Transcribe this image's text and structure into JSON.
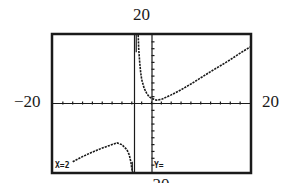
{
  "labels": {
    "ymax": "20",
    "xmin": "−20",
    "xmax": "20",
    "ymin": "−20"
  },
  "readout": {
    "x_text": "X=2",
    "y_text": "Y="
  },
  "colors": {
    "ink": "#1a1a1a",
    "background": "#ffffff"
  },
  "chart_data": {
    "type": "line",
    "title": "",
    "xlabel": "",
    "ylabel": "",
    "xlim": [
      -20,
      20
    ],
    "ylim": [
      -20,
      20
    ],
    "grid": false,
    "x_tick_spacing": 2,
    "y_tick_spacing": 2,
    "window_labels": {
      "top": "20",
      "left": "-20",
      "right": "20",
      "bottom": "-20"
    },
    "vertical_asymptote_x": -3.4,
    "trace_readout": {
      "x": "X=2",
      "y": "Y="
    },
    "series": [
      {
        "name": "right-branch",
        "x": [
          -2.7,
          -2.6,
          -2.4,
          -2.2,
          -2.0,
          -1.5,
          -1.0,
          -0.5,
          0,
          1,
          2,
          4,
          6,
          8,
          10,
          12,
          14,
          16,
          18,
          20
        ],
        "y": [
          20,
          16,
          12,
          9,
          7,
          4.5,
          3,
          2,
          1.5,
          1,
          1.2,
          2.5,
          4,
          5.7,
          7.5,
          9.3,
          11,
          12.8,
          14.7,
          16.5
        ]
      },
      {
        "name": "left-branch",
        "x": [
          -16,
          -14,
          -12,
          -10,
          -8,
          -7,
          -6,
          -5,
          -4.5,
          -4.2,
          -4.0,
          -3.8
        ],
        "y": [
          -17,
          -15.5,
          -14.2,
          -13,
          -12,
          -11.5,
          -12,
          -13.5,
          -15,
          -17,
          -19,
          -20
        ]
      }
    ]
  }
}
